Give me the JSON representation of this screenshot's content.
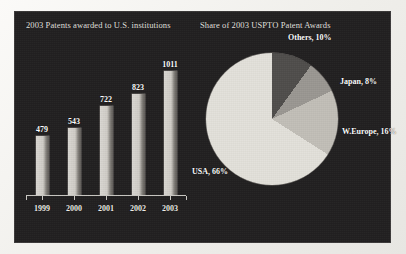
{
  "figure": {
    "panel_background": "#211f20"
  },
  "bar_panel": {
    "title": "2003 Patents awarded to U.S. institutions"
  },
  "pie_panel": {
    "title": "Share of 2003 USPTO Patent Awards"
  },
  "labels": {
    "others": "Others, 10%",
    "japan": "Japan, 8%",
    "weurope": "W.Europe, 16%",
    "usa": "USA, 66%"
  },
  "chart_data": [
    {
      "type": "bar",
      "title": "2003 Patents awarded to U.S. institutions",
      "categories": [
        "1999",
        "2000",
        "2001",
        "2002",
        "2003"
      ],
      "values": [
        479,
        543,
        722,
        823,
        1011
      ],
      "xlabel": "",
      "ylabel": "",
      "ylim": [
        0,
        1011
      ],
      "grid": false,
      "data_labels": true,
      "bar_color": "#cfccc6"
    },
    {
      "type": "pie",
      "title": "Share of 2003 USPTO Patent Awards",
      "labels": [
        "USA",
        "Others",
        "Japan",
        "W.Europe"
      ],
      "values": [
        66,
        10,
        8,
        16
      ],
      "value_suffix": "%",
      "annotations": [
        "USA, 66%",
        "Others, 10%",
        "Japan, 8%",
        "W.Europe, 16%"
      ],
      "legend": "none",
      "colors": [
        "#e3e1da",
        "#4f4d4b",
        "#9a9792",
        "#c2bfb8"
      ]
    }
  ]
}
